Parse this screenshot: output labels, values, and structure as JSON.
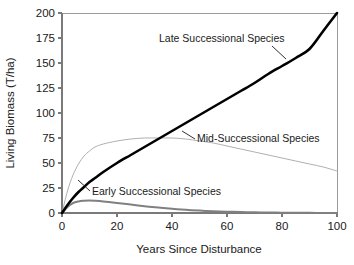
{
  "chart_data": {
    "type": "line",
    "title": "",
    "xlabel": "Years Since Disturbance",
    "ylabel": "Living Biomass (T/ha)",
    "xlim": [
      0,
      100
    ],
    "ylim": [
      0,
      200
    ],
    "xticks": [
      0,
      20,
      40,
      60,
      80,
      100
    ],
    "yticks": [
      0,
      25,
      50,
      75,
      100,
      125,
      150,
      175,
      200
    ],
    "xtick_labels": [
      "0",
      "20",
      "40",
      "60",
      "80",
      "100"
    ],
    "ytick_labels": [
      "0",
      "25",
      "50",
      "75",
      "100",
      "125",
      "150",
      "175",
      "200"
    ],
    "grid": false,
    "legend_position": "inline-annotations",
    "x": [
      0,
      2,
      4,
      6,
      8,
      10,
      12,
      15,
      20,
      25,
      30,
      35,
      40,
      45,
      50,
      55,
      60,
      65,
      70,
      75,
      80,
      85,
      90,
      95,
      100
    ],
    "series": [
      {
        "name": "Late Successional Species",
        "color": "#000000",
        "line_width": 2.6,
        "values": [
          0,
          8,
          15,
          21,
          26,
          31,
          35,
          41,
          50,
          58,
          66,
          74,
          82,
          90,
          98,
          106,
          114,
          122,
          130,
          139,
          147,
          155,
          164,
          182,
          200
        ]
      },
      {
        "name": "Mid-Successional Species",
        "color": "#b0b0b0",
        "line_width": 1.0,
        "values": [
          0,
          22,
          38,
          49,
          57,
          62,
          66,
          69,
          72,
          74,
          75,
          75,
          75,
          74,
          72,
          70,
          67,
          64,
          61,
          58,
          55,
          52,
          49,
          46,
          42
        ]
      },
      {
        "name": "Early Successional Species",
        "color": "#808080",
        "line_width": 2.0,
        "values": [
          0,
          6,
          10,
          11.6,
          12.2,
          12.4,
          12.2,
          11.6,
          10.1,
          8.4,
          6.8,
          5.4,
          4.2,
          3.2,
          2.4,
          1.8,
          1.3,
          1.0,
          0.7,
          0.5,
          0.35,
          0.25,
          0.15,
          0.08,
          0.0
        ]
      }
    ],
    "annotations": [
      {
        "text": "Late Successional Species",
        "x_px": 159,
        "y_px": 42
      },
      {
        "text": "Mid-Successional Species",
        "x_px": 197,
        "y_px": 142
      },
      {
        "text": "Early Successional Species",
        "x_px": 92,
        "y_px": 195
      }
    ]
  }
}
